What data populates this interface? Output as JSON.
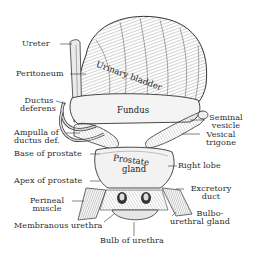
{
  "figure": {
    "type": "anatomical-illustration",
    "colors": {
      "ink": "#2b2b2b",
      "background": "#ffffff",
      "shade": "#bdbdbd"
    }
  },
  "labels_left": [
    {
      "id": "ureter",
      "text": "Ureter"
    },
    {
      "id": "peritoneum",
      "text": "Peritoneum"
    },
    {
      "id": "ductus_deferens",
      "line1": "Ductus",
      "line2": "deferens"
    },
    {
      "id": "ampulla",
      "line1": "Ampulla of",
      "line2": "ductus def."
    },
    {
      "id": "base_prostate",
      "text": "Base of prostate"
    },
    {
      "id": "apex_prostate",
      "text": "Apex of prostate"
    },
    {
      "id": "perineal_muscle",
      "line1": "Perineal",
      "line2": "muscle"
    },
    {
      "id": "membranous_urethra",
      "text": "Membranous urethra"
    }
  ],
  "labels_right": [
    {
      "id": "seminal_vesicle",
      "line1": "Seminal",
      "line2": "vesicle"
    },
    {
      "id": "vesical_trigone",
      "line1": "Vesical",
      "line2": "trigone"
    },
    {
      "id": "right_lobe",
      "text": "Right lobe"
    },
    {
      "id": "excretory_duct",
      "line1": "Excretory",
      "line2": "duct"
    },
    {
      "id": "bulbourethral_gland",
      "line1": "Bulbo-",
      "line2": "urethral gland"
    }
  ],
  "labels_bottom": [
    {
      "id": "bulb_urethra",
      "text": "Bulb of urethra"
    }
  ],
  "labels_inner": [
    {
      "id": "urinary_bladder",
      "text": "Urinary bladder"
    },
    {
      "id": "fundus",
      "text": "Fundus"
    },
    {
      "id": "prostate_gland",
      "line1": "Prostate",
      "line2": "gland"
    }
  ]
}
